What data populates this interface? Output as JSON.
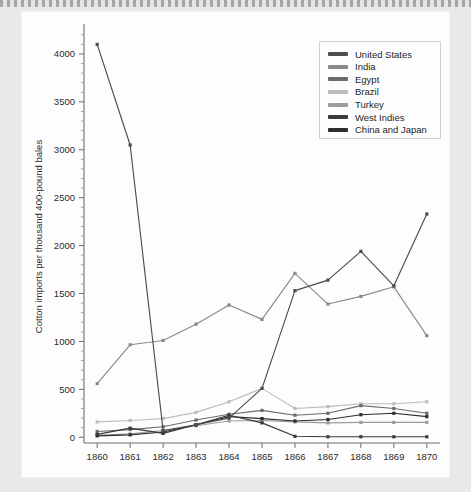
{
  "page": {
    "background_color": "#e9e9e9",
    "card_color": "#fdfdfd"
  },
  "chart_data": {
    "type": "line",
    "title": "",
    "subtitle": "",
    "xlabel": "",
    "ylabel": "Cotton imports per thousand 400-pound bales",
    "x": [
      1860,
      1861,
      1862,
      1863,
      1864,
      1865,
      1866,
      1867,
      1868,
      1869,
      1870
    ],
    "categories": [
      "1860",
      "1861",
      "1862",
      "1863",
      "1864",
      "1865",
      "1866",
      "1867",
      "1868",
      "1869",
      "1870"
    ],
    "xlim": [
      1859.6,
      1870.4
    ],
    "ylim": [
      -60,
      4250
    ],
    "yticks": [
      0,
      500,
      1000,
      1500,
      2000,
      2500,
      3000,
      3500,
      4000
    ],
    "ytick_labels": [
      "0",
      "500",
      "1000",
      "1500",
      "2000",
      "2500",
      "3000",
      "3500",
      "4000"
    ],
    "grid": false,
    "legend_position": "upper right",
    "markers": true,
    "series": [
      {
        "name": "United States",
        "color": "#4d4d4d",
        "values": [
          4100,
          3050,
          70,
          130,
          200,
          510,
          1530,
          1640,
          1940,
          1580,
          2330
        ]
      },
      {
        "name": "India",
        "color": "#8a8a8a",
        "values": [
          560,
          965,
          1010,
          1180,
          1380,
          1230,
          1710,
          1390,
          1470,
          1570,
          1060
        ]
      },
      {
        "name": "Egypt",
        "color": "#6b6b6b",
        "values": [
          60,
          80,
          110,
          180,
          240,
          280,
          230,
          250,
          330,
          300,
          250
        ]
      },
      {
        "name": "Brazil",
        "color": "#bdbdbd",
        "values": [
          160,
          175,
          195,
          260,
          370,
          510,
          300,
          320,
          350,
          350,
          370
        ]
      },
      {
        "name": "Turkey",
        "color": "#9c9c9c",
        "values": [
          20,
          35,
          70,
          120,
          170,
          175,
          160,
          150,
          155,
          155,
          155
        ]
      },
      {
        "name": "West Indies",
        "color": "#3a3a3a",
        "values": [
          30,
          95,
          40,
          130,
          230,
          150,
          10,
          5,
          5,
          5,
          5
        ]
      },
      {
        "name": "China and Japan",
        "color": "#2e2e2e",
        "values": [
          15,
          25,
          55,
          130,
          215,
          195,
          170,
          185,
          235,
          250,
          215
        ]
      }
    ]
  },
  "legend": {
    "entries": [
      {
        "label": "United States",
        "color": "#4d4d4d"
      },
      {
        "label": "India",
        "color": "#8a8a8a"
      },
      {
        "label": "Egypt",
        "color": "#6b6b6b"
      },
      {
        "label": "Brazil",
        "color": "#bdbdbd"
      },
      {
        "label": "Turkey",
        "color": "#9c9c9c"
      },
      {
        "label": "West Indies",
        "color": "#3a3a3a"
      },
      {
        "label": "China and Japan",
        "color": "#2e2e2e"
      }
    ]
  }
}
